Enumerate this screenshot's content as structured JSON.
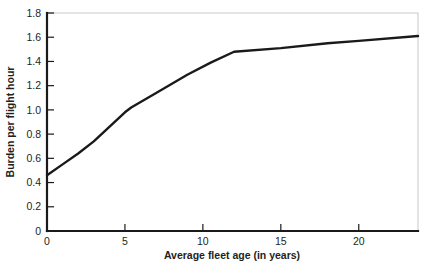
{
  "chart_data": {
    "type": "line",
    "title": "",
    "xlabel": "Average fleet age (in years)",
    "ylabel": "Burden per flight hour",
    "xlim": [
      0,
      23.8
    ],
    "ylim": [
      0,
      1.8
    ],
    "grid": false,
    "legend": "none",
    "xticks": [
      0,
      5,
      10,
      15,
      20
    ],
    "xticklabels": [
      "0",
      "5",
      "10",
      "15",
      "20"
    ],
    "yticks": [
      0,
      0.2,
      0.4,
      0.6,
      0.8,
      1.0,
      1.2,
      1.4,
      1.6,
      1.8
    ],
    "yticklabels": [
      "0",
      "0.2",
      "0.4",
      "0.6",
      "0.8",
      "1.0",
      "1.2",
      "1.4",
      "1.6",
      "1.8"
    ],
    "series": [
      {
        "name": "Burden per flight hour",
        "color": "#1a1a1a",
        "x": [
          0,
          1,
          2,
          3,
          4,
          5,
          5.4,
          7,
          9,
          10.5,
          12,
          15,
          18,
          20,
          23.8
        ],
        "y": [
          0.46,
          0.55,
          0.64,
          0.74,
          0.86,
          0.98,
          1.02,
          1.14,
          1.29,
          1.39,
          1.48,
          1.51,
          1.55,
          1.57,
          1.61
        ]
      }
    ]
  },
  "axis_titles": {
    "x": "Average fleet age (in years)",
    "y": "Burden per flight hour"
  }
}
